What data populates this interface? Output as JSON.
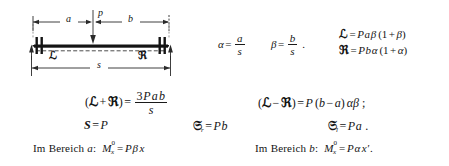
{
  "figure": {
    "label_a": "a",
    "label_p": "p",
    "label_b": "b",
    "label_s": "s",
    "label_left_moment": "ℒ",
    "label_right_moment": "ℜ"
  },
  "equations": {
    "alpha": {
      "lhs": "α",
      "eq": "=",
      "num": "a",
      "den": "s"
    },
    "beta": {
      "lhs": "β",
      "eq": "=",
      "num": "b",
      "den": "s",
      "punct": "."
    },
    "L_def": {
      "lhs": "ℒ",
      "eq": "=",
      "rhs_P": "P",
      "rhs_a": "a",
      "rhs_beta": "β",
      "paren_open": "(",
      "one": "1",
      "plus": "+",
      "inner": "β",
      "paren_close": ")"
    },
    "R_def": {
      "lhs": "ℜ",
      "eq": "=",
      "rhs_P": "P",
      "rhs_b": "b",
      "rhs_alpha": "α",
      "paren_open": "(",
      "one": "1",
      "plus": "+",
      "inner": "α",
      "paren_close": ")"
    },
    "sum": {
      "paren_open": "(",
      "L": "ℒ",
      "plus": "+",
      "R": "ℜ",
      "paren_close": ")",
      "eq": "=",
      "num_3": "3",
      "num_P": "P",
      "num_a": "a",
      "num_b": "b",
      "den": "s"
    },
    "diff": {
      "paren_open": "(",
      "L": "ℒ",
      "minus": "−",
      "R": "ℜ",
      "paren_close": ")",
      "eq": "=",
      "P": "P",
      "grp_open": "(",
      "b": "b",
      "gminus": "−",
      "a": "a",
      "grp_close": ")",
      "alpha": "α",
      "beta": "β",
      "punct": ";"
    },
    "S": {
      "lhs": "S",
      "eq": "=",
      "rhs": "P"
    },
    "Sr": {
      "lhs": "𝔖",
      "sub": "r",
      "eq": "=",
      "rhs_P": "P",
      "rhs_b": "b"
    },
    "Sl": {
      "lhs": "𝔖",
      "sub": "l",
      "eq": "=",
      "rhs_P": "P",
      "rhs_a": "a",
      "punct": "."
    },
    "range_a": {
      "text_im": "Im",
      "text_bereich": "Bereich",
      "var": "a",
      "colon": ":",
      "M": "M",
      "sup": "0",
      "sub": "x",
      "eq": "=",
      "P": "P",
      "beta": "β",
      "x": "x"
    },
    "range_b": {
      "text_im": "Im",
      "text_bereich": "Bereich",
      "var": "b",
      "colon": ":",
      "M": "M",
      "sup": "0",
      "sub": "x",
      "eq": "=",
      "P": "P",
      "alpha": "α",
      "x": "x′",
      "punct": "."
    }
  },
  "colors": {
    "ink": "#1a1a1a",
    "paper": "#ffffff"
  }
}
